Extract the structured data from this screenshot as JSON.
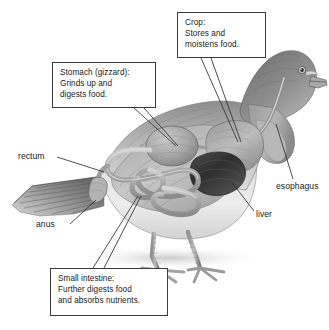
{
  "figure": {
    "background_color": "#ffffff",
    "line_color": "#3a3a3a",
    "text_color": "#1a1a1a"
  },
  "callouts": [
    {
      "id": "crop",
      "text": "Crop:\nStores and\nmoistens food.",
      "lines": [
        "Crop:",
        "Stores and",
        "moistens food."
      ]
    },
    {
      "id": "stomach",
      "text": "Stomach (gizzard):\nGrinds up and\ndigests food.",
      "lines": [
        "Stomach (gizzard):",
        "Grinds up and",
        "digests food."
      ]
    },
    {
      "id": "small_intestine",
      "text": "Small intestine:\nFurther digests food\nand absorbs nutrients.",
      "lines": [
        "Small intestine:",
        "Further digests food",
        "and absorbs nutrients."
      ]
    }
  ],
  "labels": {
    "rectum": "rectum",
    "anus": "anus",
    "esophagus": "esophagus",
    "liver": "liver"
  },
  "illustration": {
    "subject": "pigeon",
    "style": "pencil-shaded grayscale drawing",
    "organs": [
      "esophagus",
      "crop",
      "stomach (gizzard)",
      "liver",
      "small intestine",
      "rectum",
      "anus"
    ]
  }
}
